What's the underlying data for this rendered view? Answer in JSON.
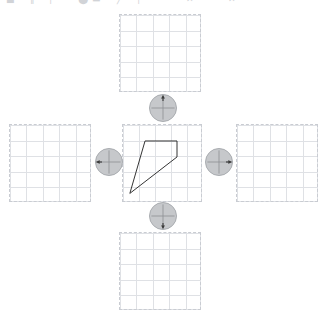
{
  "canvas": {
    "width": 321,
    "height": 320,
    "background": "#ffffff"
  },
  "toolbar": {
    "visible": true,
    "clipped": true,
    "icons": [
      {
        "name": "shape-tool-icon",
        "glyph": "■",
        "x": 6
      },
      {
        "name": "move-tool-icon",
        "glyph": "‖",
        "x": 30
      },
      {
        "name": "line-tool-icon",
        "glyph": "│",
        "x": 48
      },
      {
        "name": "fill-tool-icon",
        "glyph": "⬤",
        "x": 78
      },
      {
        "name": "eraser-tool-icon",
        "glyph": "▬",
        "x": 92
      },
      {
        "name": "pen-tool-icon",
        "glyph": "╱",
        "x": 117
      },
      {
        "name": "text-tool-icon",
        "glyph": "│",
        "x": 136
      },
      {
        "name": "select-tool-icon",
        "glyph": "✕",
        "x": 186
      },
      {
        "name": "options-tool-icon",
        "glyph": "✕",
        "x": 228
      }
    ]
  },
  "colors": {
    "grid_line": "#dfe1e5",
    "grid_border": "#c9ccd2",
    "shape_stroke": "#2e2e2e",
    "knob_fill": "#c6c8cb",
    "knob_border": "#a9acb0",
    "knob_cross": "#8e9196",
    "arrow": "#3a3a3a"
  },
  "grids": [
    {
      "name": "grid-top",
      "label": "Top target grid",
      "x": 119,
      "y": 14,
      "width": 82,
      "height": 78,
      "cols": 5,
      "rows": 5,
      "cell": 16.0,
      "has_shape": false,
      "empty": true
    },
    {
      "name": "grid-left",
      "label": "Left target grid",
      "x": 9,
      "y": 124,
      "width": 82,
      "height": 78,
      "cols": 5,
      "rows": 5,
      "cell": 16.0,
      "has_shape": false,
      "empty": true
    },
    {
      "name": "grid-center",
      "label": "Source grid",
      "x": 122,
      "y": 124,
      "width": 80,
      "height": 78,
      "cols": 5,
      "rows": 5,
      "cell": 15.6,
      "has_shape": true,
      "empty": false
    },
    {
      "name": "grid-right",
      "label": "Right target grid",
      "x": 236,
      "y": 124,
      "width": 82,
      "height": 78,
      "cols": 5,
      "rows": 5,
      "cell": 16.0,
      "has_shape": false,
      "empty": true
    },
    {
      "name": "grid-bottom",
      "label": "Bottom target grid",
      "x": 119,
      "y": 232,
      "width": 82,
      "height": 78,
      "cols": 5,
      "rows": 5,
      "cell": 16.0,
      "has_shape": false,
      "empty": true
    }
  ],
  "shape": {
    "name": "quadrilateral",
    "type": "polygon",
    "closed": true,
    "stroke": "#2e2e2e",
    "stroke_width": 1,
    "fill": "none",
    "grid_units": {
      "cols": 5,
      "rows": 5
    },
    "vertices_grid": [
      {
        "label": "A",
        "col": 1.45,
        "row": 1.05
      },
      {
        "label": "B",
        "col": 3.55,
        "row": 1.05
      },
      {
        "label": "C",
        "col": 3.55,
        "row": 2.1
      },
      {
        "label": "D",
        "col": 0.45,
        "row": 4.5
      }
    ],
    "vertices_px": [
      {
        "label": "A",
        "x": 22.6,
        "y": 16.4
      },
      {
        "label": "B",
        "x": 55.4,
        "y": 16.4
      },
      {
        "label": "C",
        "x": 55.4,
        "y": 32.8
      },
      {
        "label": "D",
        "x": 7.0,
        "y": 70.2
      }
    ],
    "points_attr": "22.6,16.4 55.4,16.4 55.4,32.8 7.0,70.2"
  },
  "knobs": [
    {
      "name": "knob-up",
      "label": "Translate up",
      "direction": "up",
      "x": 149,
      "y": 94,
      "size": 28,
      "arrow_angle_deg": 270
    },
    {
      "name": "knob-left",
      "label": "Translate left",
      "direction": "left",
      "x": 95,
      "y": 148,
      "size": 28,
      "arrow_angle_deg": 180
    },
    {
      "name": "knob-right",
      "label": "Translate right",
      "direction": "right",
      "x": 205,
      "y": 148,
      "size": 28,
      "arrow_angle_deg": 0
    },
    {
      "name": "knob-down",
      "label": "Translate down",
      "direction": "down",
      "x": 149,
      "y": 202,
      "size": 28,
      "arrow_angle_deg": 90
    }
  ]
}
